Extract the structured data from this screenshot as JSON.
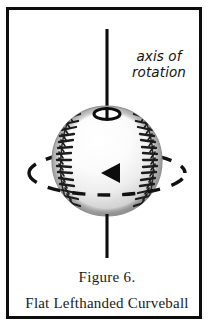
{
  "figure": {
    "annotation": {
      "name": "axis-of-rotation-label",
      "line1": "axis of",
      "line2": "rotation"
    },
    "caption": {
      "title": "Figure 6.",
      "subtitle": "Flat Lefthanded Curveball"
    },
    "illustration": {
      "subject": "baseball",
      "rotation_direction": "leftward",
      "arrow_glyph": "◀",
      "elements": [
        "vertical-rotation-axis-line",
        "pole-ellipse-marker",
        "baseball-sphere",
        "left-seam",
        "right-seam",
        "dashed-equator-ellipse",
        "direction-arrow"
      ]
    },
    "colors": {
      "frame": "#0d0d0d",
      "ink": "#111111",
      "ball_light": "#ffffff",
      "ball_shadow": "#9a9a9a",
      "seam": "#1c1c1c",
      "page": "#ffffff"
    }
  }
}
